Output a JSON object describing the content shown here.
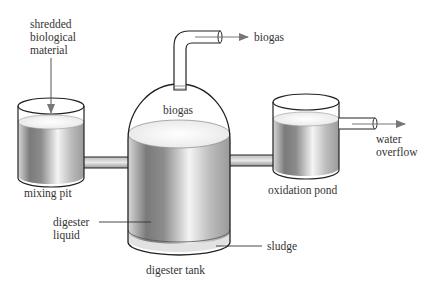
{
  "diagram": {
    "labels": {
      "input": "shredded\nbiological\nmaterial",
      "gas_out": "biogas",
      "dome_gas": "biogas",
      "water_out": "water\noverflow",
      "mixing_pit": "mixing pit",
      "oxidation_pond": "oxidation pond",
      "digester_liquid": "digester\nliquid",
      "sludge": "sludge",
      "digester_tank": "digester tank"
    },
    "components": [
      {
        "id": "mixing-pit",
        "label": "mixing pit"
      },
      {
        "id": "digester-tank",
        "label": "digester tank"
      },
      {
        "id": "oxidation-pond",
        "label": "oxidation pond"
      },
      {
        "id": "gas-dome",
        "label": "biogas"
      },
      {
        "id": "gas-outlet-pipe",
        "label": "biogas"
      },
      {
        "id": "overflow-pipe",
        "label": "water overflow"
      }
    ],
    "flows": [
      {
        "from": "shredded biological material",
        "to": "mixing pit"
      },
      {
        "from": "mixing pit",
        "to": "digester tank"
      },
      {
        "from": "digester tank",
        "to": "oxidation pond"
      },
      {
        "from": "digester tank",
        "to": "biogas"
      },
      {
        "from": "oxidation pond",
        "to": "water overflow"
      }
    ],
    "colors": {
      "line": "#222222",
      "arrow": "#777777",
      "liquid_light": "#f2f2f2",
      "liquid_dark": "#6e6e6e"
    }
  }
}
